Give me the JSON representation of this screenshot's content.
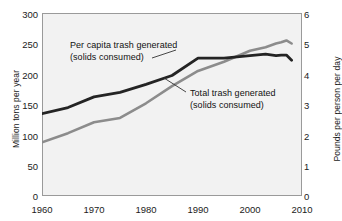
{
  "chart_data": {
    "type": "line",
    "title": "",
    "xlabel": "",
    "ylabel": "Million tons per year",
    "ylabel_right": "Pounds per person per day",
    "xlim": [
      1960,
      2010
    ],
    "ylim": [
      0,
      300
    ],
    "ylim_right": [
      0,
      6
    ],
    "grid": false,
    "legend_position": "inline-annotations",
    "x_ticks": [
      "1960",
      "1970",
      "1980",
      "1990",
      "2000",
      "2010"
    ],
    "y_ticks_left": [
      "0",
      "50",
      "100",
      "150",
      "200",
      "250",
      "300"
    ],
    "y_ticks_right": [
      "0",
      "1",
      "2",
      "3",
      "4",
      "5",
      "6"
    ],
    "series": [
      {
        "name": "Per capita trash generated (solids consumed)",
        "axis": "right",
        "units": "pounds per person per day",
        "color": "#242424",
        "x": [
          1960,
          1965,
          1970,
          1975,
          1980,
          1985,
          1990,
          1995,
          2000,
          2003,
          2005,
          2006,
          2007,
          2008
        ],
        "values": [
          2.7,
          2.9,
          3.25,
          3.4,
          3.66,
          3.95,
          4.52,
          4.52,
          4.6,
          4.65,
          4.6,
          4.62,
          4.62,
          4.45
        ]
      },
      {
        "name": "Total trash generated (solids consumed)",
        "axis": "left",
        "units": "million tons per year",
        "color": "#8c8c8c",
        "x": [
          1960,
          1965,
          1970,
          1975,
          1980,
          1985,
          1990,
          1995,
          2000,
          2003,
          2005,
          2006,
          2007,
          2008
        ],
        "values": [
          88,
          103,
          121,
          128,
          152,
          180,
          205,
          220,
          238,
          244,
          250,
          252,
          255,
          250
        ]
      }
    ],
    "annotations": [
      {
        "name": "per-capita-annotation",
        "text": "Per capita trash generated\n(solids consumed)",
        "leader_from": [
          152,
          58
        ],
        "leader_to": [
          176,
          50
        ]
      },
      {
        "name": "total-annotation",
        "text": "Total trash generated\n(solids consumed)",
        "leader_from": [
          186,
          92
        ],
        "leader_to": [
          164,
          78
        ]
      }
    ]
  },
  "colors": {
    "per_capita_line": "#242424",
    "total_line": "#8c8c8c",
    "plot_background": "#f2f2f2",
    "frame": "#9a9a9a",
    "text": "#1b1b1b"
  }
}
